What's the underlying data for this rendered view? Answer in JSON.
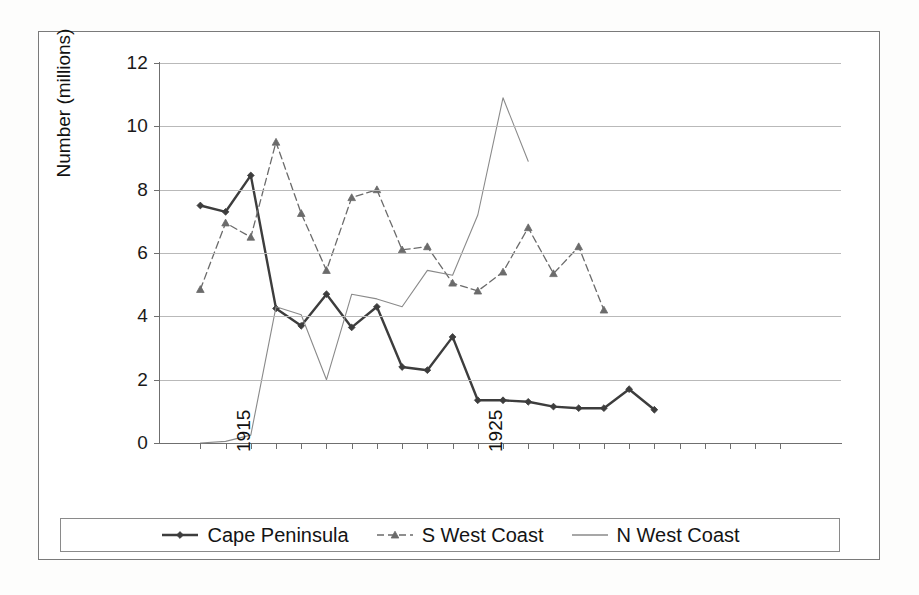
{
  "chart_data": {
    "type": "line",
    "title": "",
    "xlabel": "",
    "ylabel": "Number (millions)",
    "ylim": [
      0,
      12
    ],
    "yticks": [
      0,
      2,
      4,
      6,
      8,
      10,
      12
    ],
    "grid": true,
    "legend_position": "bottom",
    "x_tick_count": 24,
    "x_labeled_ticks": [
      {
        "index": 1,
        "label": "1915"
      },
      {
        "index": 11,
        "label": "1925"
      }
    ],
    "x": [
      1914,
      1915,
      1916,
      1917,
      1918,
      1919,
      1920,
      1921,
      1922,
      1923,
      1924,
      1925,
      1926,
      1927,
      1928,
      1929,
      1930,
      1931,
      1932,
      1933,
      1934,
      1935,
      1936,
      1937
    ],
    "series": [
      {
        "name": "Cape Peninsula",
        "marker": "diamond",
        "line_style": "solid",
        "color": "#3d3d3d",
        "values": [
          7.5,
          7.3,
          8.45,
          4.25,
          3.7,
          4.7,
          3.65,
          4.3,
          2.4,
          2.3,
          3.35,
          1.35,
          1.35,
          1.3,
          1.15,
          1.1,
          1.1,
          1.7,
          1.05,
          null,
          null,
          null,
          null,
          null
        ]
      },
      {
        "name": "S West Coast",
        "marker": "triangle",
        "line_style": "dashed",
        "color": "#6b6b6b",
        "values": [
          4.85,
          6.95,
          6.5,
          9.5,
          7.25,
          5.45,
          7.75,
          8.0,
          6.1,
          6.2,
          5.05,
          4.8,
          5.4,
          6.8,
          5.35,
          6.2,
          4.2,
          null,
          null,
          null,
          null,
          null,
          null,
          null
        ]
      },
      {
        "name": "N West Coast",
        "marker": "none",
        "line_style": "solid-thin",
        "color": "#8a8a8a",
        "values": [
          0.0,
          0.05,
          0.25,
          4.3,
          4.05,
          2.0,
          4.7,
          4.55,
          4.3,
          5.45,
          5.3,
          7.2,
          10.9,
          8.9,
          null,
          null,
          null,
          null,
          null,
          null,
          null,
          null,
          null,
          null
        ]
      }
    ]
  },
  "axis": {
    "y_title": "Number (millions)",
    "y_tick_labels": [
      "12",
      "10",
      "8",
      "6",
      "4",
      "2",
      "0"
    ]
  },
  "legend": {
    "items": [
      {
        "label": "Cape Peninsula",
        "key": "solid-diamond"
      },
      {
        "label": "S West Coast",
        "key": "dashed-triangle"
      },
      {
        "label": "N West Coast",
        "key": "plain-line"
      }
    ]
  }
}
